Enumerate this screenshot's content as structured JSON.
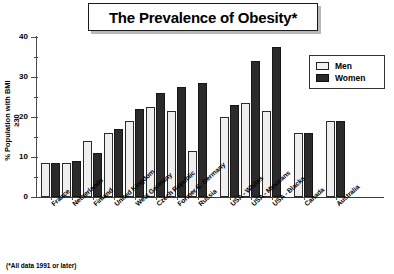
{
  "title": "The Prevalence of Obesity*",
  "footnote": "(*All data 1991 or later)",
  "legend": {
    "men_label": "Men",
    "women_label": "Women",
    "men_color": "#f2f2f2",
    "women_color": "#2b2b2b"
  },
  "axis": {
    "y_label_line1": "% Population with BMI",
    "y_label_line2": "≥30",
    "y_ticks": [
      "0",
      "10",
      "20",
      "30",
      "40"
    ]
  },
  "chart_data": {
    "type": "bar",
    "title": "The Prevalence of Obesity*",
    "xlabel": "",
    "ylabel": "% Population with BMI ≥30",
    "ylim": [
      0,
      40
    ],
    "yticks": [
      0,
      10,
      20,
      30,
      40
    ],
    "grid": false,
    "legend_position": "top-right",
    "annotations": [
      "(*All data 1991 or later)"
    ],
    "categories": [
      "France",
      "Netherlands",
      "Finland",
      "United Kingdom",
      "West Germany",
      "Czech Republic",
      "Former E. Germany",
      "Russia",
      "USA - Whites",
      "USA - Mexicans",
      "USA - Blacks",
      "Canada",
      "Australia"
    ],
    "series": [
      {
        "name": "Men",
        "values": [
          8.5,
          8.5,
          14.0,
          16.0,
          19.0,
          22.5,
          21.5,
          11.5,
          20.0,
          23.5,
          21.5,
          16.0,
          19.0
        ]
      },
      {
        "name": "Women",
        "values": [
          8.5,
          9.0,
          11.0,
          17.0,
          22.0,
          26.0,
          27.5,
          28.5,
          23.0,
          34.0,
          37.5,
          16.0,
          19.0
        ]
      }
    ],
    "group_breaks_after": [
      "Russia",
      "USA - Blacks",
      "Canada"
    ]
  }
}
